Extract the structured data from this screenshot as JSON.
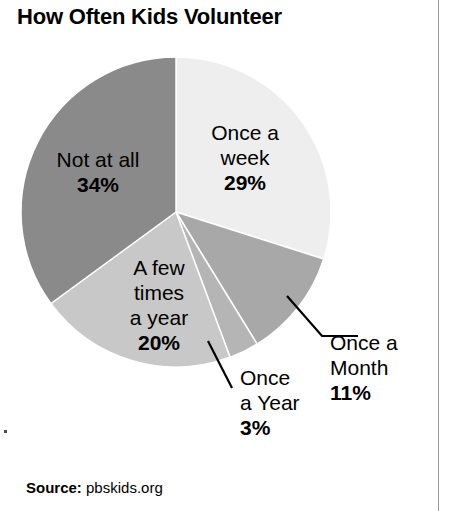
{
  "title": "How Often Kids Volunteer",
  "source": {
    "label": "Source:",
    "value": "pbskids.org"
  },
  "labels": {
    "once_a_week": {
      "line1": "Once a",
      "line2": "week",
      "pct": "29%"
    },
    "not_at_all": {
      "line1": "Not at all",
      "pct": "34%"
    },
    "a_few_times": {
      "line1": "A few",
      "line2": "times",
      "line3": "a year",
      "pct": "20%"
    },
    "once_a_month": {
      "line1": "Once a",
      "line2": "Month",
      "pct": "11%"
    },
    "once_a_year": {
      "line1": "Once",
      "line2": "a Year",
      "pct": "3%"
    }
  },
  "chart_data": {
    "type": "pie",
    "title": "How Often Kids Volunteer",
    "source": "pbskids.org",
    "units": "percent",
    "start_angle_deg": 0,
    "direction": "clockwise",
    "categories": [
      "Once a week",
      "Once a Month",
      "Once a Year",
      "A few times a year",
      "Not at all"
    ],
    "values": [
      29,
      11,
      3,
      20,
      34
    ],
    "slices": [
      {
        "label": "Once a week",
        "value": 29,
        "display": "29%",
        "color": "#eeeeee",
        "label_placement": "inside"
      },
      {
        "label": "Once a Month",
        "value": 11,
        "display": "11%",
        "color": "#a8a8a8",
        "label_placement": "outside-leader"
      },
      {
        "label": "Once a Year",
        "value": 3,
        "display": "3%",
        "color": "#b5b5b5",
        "label_placement": "outside-leader"
      },
      {
        "label": "A few times a year",
        "value": 20,
        "display": "20%",
        "color": "#c8c8c8",
        "label_placement": "inside"
      },
      {
        "label": "Not at all",
        "value": 34,
        "display": "34%",
        "color": "#8a8a8a",
        "label_placement": "inside"
      }
    ],
    "legend": "none",
    "grid": false
  },
  "geometry": {
    "center_x": 176,
    "center_y": 212,
    "radius": 155
  },
  "colors": {
    "background": "#ffffff",
    "text": "#000000",
    "rule": "#9a9a9a",
    "slice_outline": "#ffffff"
  }
}
